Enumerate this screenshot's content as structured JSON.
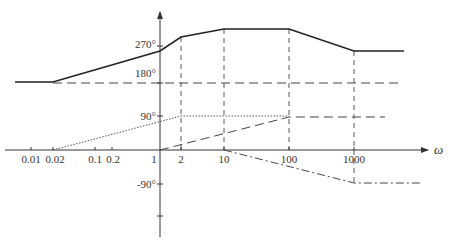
{
  "diagram": {
    "type": "bode-phase-asymptotic",
    "x_axis": {
      "label": "ω",
      "ticks": [
        {
          "label": "0.01",
          "x": 31
        },
        {
          "label": "0.02",
          "x": 53
        },
        {
          "label": "0.1",
          "x": 95
        },
        {
          "label": "0.2",
          "x": 112
        },
        {
          "label": "1",
          "x": 160
        },
        {
          "label": "2",
          "x": 181
        },
        {
          "label": "10",
          "x": 224
        },
        {
          "label": "100",
          "x": 289
        },
        {
          "label": "1000",
          "x": 354
        }
      ]
    },
    "y_axis": {
      "ticks": [
        {
          "label": "270°",
          "y": 46
        },
        {
          "label": "180°",
          "y": 83
        },
        {
          "label": "90°",
          "y": 116
        },
        {
          "label": "-90°",
          "y": 184
        },
        {
          "label": "",
          "y": 216
        }
      ]
    },
    "curves": {
      "total_phase": "solid",
      "constant_180": "dashed",
      "lead_0_02_to_2": "dotted",
      "lead_1_to_100": "dashed",
      "lag_10_to_1000": "dash-dot"
    }
  }
}
